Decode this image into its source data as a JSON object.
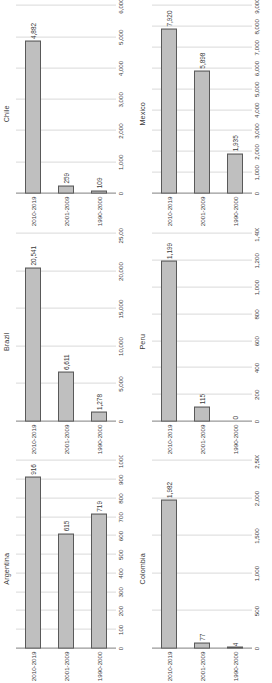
{
  "page": {
    "units_label": "US$ millions",
    "categories": [
      "1990-2000",
      "2001-2009",
      "2010-2019"
    ],
    "bar_fill": "#bfbfbf",
    "bar_border": "#595959",
    "gridline_color": "#d9d9d9",
    "orientation": "rotated-90-ccw"
  },
  "chart_data": [
    {
      "type": "bar",
      "title": "Chile",
      "categories": [
        "1990-2000",
        "2001-2009",
        "2010-2019"
      ],
      "values": [
        109,
        259,
        4882
      ],
      "value_labels": [
        "109",
        "259",
        "4,882"
      ],
      "xlabel": "US$ millions",
      "ylabel": "",
      "xlim": [
        0,
        6000
      ],
      "ticks": [
        "0",
        "1,000",
        "2,000",
        "3,000",
        "4,000",
        "5,000",
        "6,000"
      ],
      "tick_values": [
        0,
        1000,
        2000,
        3000,
        4000,
        5000,
        6000
      ],
      "grid": true,
      "legend": "none"
    },
    {
      "type": "bar",
      "title": "Mexico",
      "categories": [
        "1990-2000",
        "2001-2009",
        "2010-2019"
      ],
      "values": [
        1935,
        5898,
        7920
      ],
      "value_labels": [
        "1,935",
        "5,898",
        "7,920"
      ],
      "xlabel": "US$ millions",
      "ylabel": "",
      "xlim": [
        0,
        9000
      ],
      "ticks": [
        "0",
        "1,000",
        "2,000",
        "3,000",
        "4,000",
        "5,000",
        "6,000",
        "7,000",
        "8,000",
        "9,000"
      ],
      "tick_values": [
        0,
        1000,
        2000,
        3000,
        4000,
        5000,
        6000,
        7000,
        8000,
        9000
      ],
      "grid": true,
      "legend": "none"
    },
    {
      "type": "bar",
      "title": "Brazil",
      "categories": [
        "1990-2000",
        "2001-2009",
        "2010-2019"
      ],
      "values": [
        1278,
        6611,
        20541
      ],
      "value_labels": [
        "1,278",
        "6,611",
        "20,541"
      ],
      "xlabel": "US$ millions",
      "ylabel": "",
      "xlim": [
        0,
        25000
      ],
      "ticks": [
        "0",
        "5,000",
        "10,000",
        "15,000",
        "20,000",
        "25,000"
      ],
      "tick_values": [
        0,
        5000,
        10000,
        15000,
        20000,
        25000
      ],
      "grid": true,
      "legend": "none"
    },
    {
      "type": "bar",
      "title": "Peru",
      "categories": [
        "1990-2000",
        "2001-2009",
        "2010-2019"
      ],
      "values": [
        0,
        115,
        1199
      ],
      "value_labels": [
        "0",
        "115",
        "1,199"
      ],
      "xlabel": "US$ millions",
      "ylabel": "",
      "xlim": [
        0,
        1400
      ],
      "ticks": [
        "0",
        "200",
        "400",
        "600",
        "800",
        "1,000",
        "1,200",
        "1,400"
      ],
      "tick_values": [
        0,
        200,
        400,
        600,
        800,
        1000,
        1200,
        1400
      ],
      "grid": true,
      "legend": "none"
    },
    {
      "type": "bar",
      "title": "Argentina",
      "categories": [
        "1990-2000",
        "2001-2009",
        "2010-2019"
      ],
      "values": [
        719,
        615,
        916
      ],
      "value_labels": [
        "719",
        "615",
        "916"
      ],
      "xlabel": "US$ millions",
      "ylabel": "",
      "xlim": [
        0,
        1000
      ],
      "ticks": [
        "0",
        "100",
        "200",
        "300",
        "400",
        "500",
        "600",
        "700",
        "800",
        "900",
        "1000"
      ],
      "tick_values": [
        0,
        100,
        200,
        300,
        400,
        500,
        600,
        700,
        800,
        900,
        1000
      ],
      "grid": true,
      "legend": "none"
    },
    {
      "type": "bar",
      "title": "Colombia",
      "categories": [
        "1990-2000",
        "2001-2009",
        "2010-2019"
      ],
      "values": [
        4,
        77,
        1982
      ],
      "value_labels": [
        "4",
        "77",
        "1,982"
      ],
      "xlabel": "US$ millions",
      "ylabel": "",
      "xlim": [
        0,
        2500
      ],
      "ticks": [
        "0",
        "500",
        "1,000",
        "1,500",
        "2,000",
        "2,500"
      ],
      "tick_values": [
        0,
        500,
        1000,
        1500,
        2000,
        2500
      ],
      "grid": true,
      "legend": "none"
    }
  ]
}
